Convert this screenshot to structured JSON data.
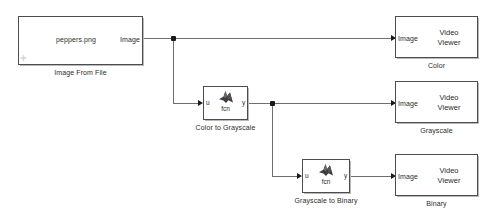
{
  "diagram": {
    "background_color": "#ffffff",
    "wire_color": "#6e6e6e",
    "block_border_color": "#4d4d4d",
    "text_color": "#2b2b2b"
  },
  "blocks": {
    "source": {
      "name": "Image From File",
      "value": "peppers.png",
      "output_port_label": "Image",
      "caption": "Image From File"
    },
    "fcn1": {
      "input_port_label": "u",
      "output_port_label": "y",
      "icon_label": "fcn",
      "icon_name": "matlab-membrane-icon",
      "caption": "Color to Grayscale"
    },
    "fcn2": {
      "input_port_label": "u",
      "output_port_label": "y",
      "icon_label": "fcn",
      "icon_name": "matlab-membrane-icon",
      "caption": "Grayscale to Binary"
    },
    "viewer_color": {
      "input_port_label": "Image",
      "line1": "Video",
      "line2": "Viewer",
      "caption": "Color"
    },
    "viewer_grayscale": {
      "input_port_label": "Image",
      "line1": "Video",
      "line2": "Viewer",
      "caption": "Grayscale"
    },
    "viewer_binary": {
      "input_port_label": "Image",
      "line1": "Video",
      "line2": "Viewer",
      "caption": "Binary"
    }
  }
}
